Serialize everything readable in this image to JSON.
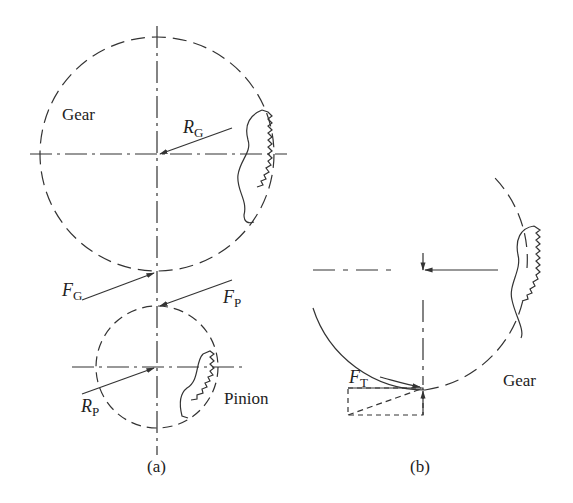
{
  "figure": {
    "panel_a": {
      "caption": "(a)",
      "gear_label": "Gear",
      "pinion_label": "Pinion",
      "radius_gear": {
        "symbol": "R",
        "subscript": "G"
      },
      "radius_pinion": {
        "symbol": "R",
        "subscript": "P"
      },
      "force_gear": {
        "symbol": "F",
        "subscript": "G"
      },
      "force_pinion": {
        "symbol": "F",
        "subscript": "P"
      }
    },
    "panel_b": {
      "caption": "(b)",
      "gear_label": "Gear",
      "tangential_force": {
        "symbol": "F",
        "subscript": "T"
      }
    },
    "colors": {
      "line": "#333333",
      "background": "#ffffff"
    }
  }
}
